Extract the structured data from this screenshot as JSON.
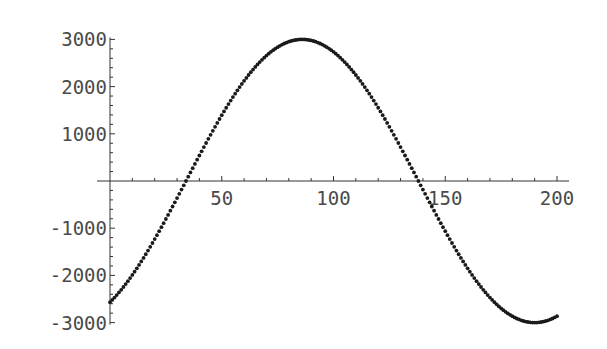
{
  "chart_data": {
    "type": "scatter",
    "title": "",
    "xlabel": "",
    "ylabel": "",
    "xlim": [
      0,
      205
    ],
    "ylim": [
      -3000,
      3000
    ],
    "grid": false,
    "legend": null,
    "x_ticks": [
      50,
      100,
      150,
      200
    ],
    "y_ticks": [
      -3000,
      -2000,
      -1000,
      1000,
      2000,
      3000
    ],
    "x_tick_labels": [
      "50",
      "100",
      "150",
      "200"
    ],
    "y_tick_labels": [
      "-3000",
      "-2000",
      "-1000",
      "1000",
      "2000",
      "3000"
    ],
    "x_minor_step": 10,
    "y_minor_step": 200,
    "series": [
      {
        "name": "sinusoid",
        "description": "Dotted sinusoid sampled at integer x from 0 to 200; amplitude ~3000, period ~208, zero crossings near x=34 and x=138, peak ~3000 near x=86, trough ~-3000 near x=190",
        "model": {
          "amplitude": 3000,
          "period": 208,
          "phase_shift": 34
        },
        "x_start": 0,
        "x_end": 200,
        "key_points": [
          {
            "x": 0,
            "y": -2520
          },
          {
            "x": 34,
            "y": 0
          },
          {
            "x": 50,
            "y": 1300
          },
          {
            "x": 86,
            "y": 3000
          },
          {
            "x": 100,
            "y": 2700
          },
          {
            "x": 138,
            "y": 0
          },
          {
            "x": 150,
            "y": -1050
          },
          {
            "x": 190,
            "y": -3000
          },
          {
            "x": 200,
            "y": -2850
          }
        ]
      }
    ],
    "colors": {
      "points": "#1a1a1a",
      "axes": "#333333",
      "labels": "#4a4a4a"
    }
  }
}
